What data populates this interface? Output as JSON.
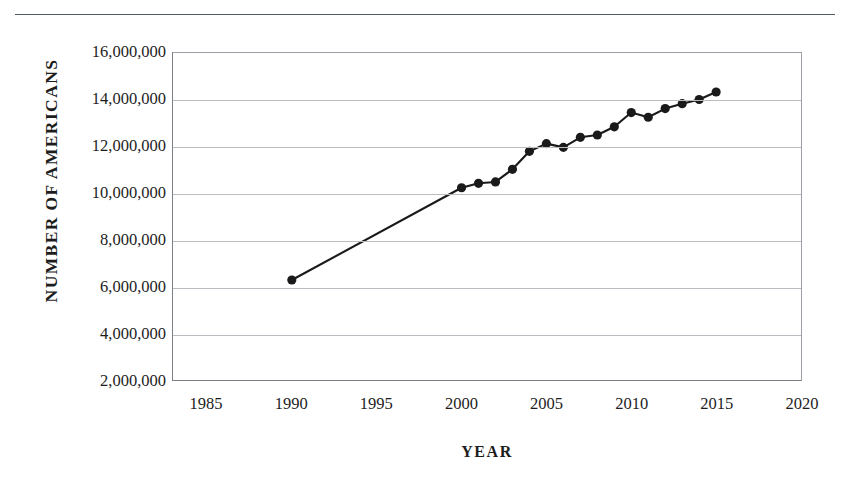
{
  "document": {
    "top_rule": "horizontal-rule"
  },
  "chart_data": {
    "type": "line",
    "title": "",
    "xlabel": "YEAR",
    "ylabel": "NUMBER OF AMERICANS",
    "xlim": [
      1983,
      2020
    ],
    "ylim": [
      2000000,
      16000000
    ],
    "grid": true,
    "legend": false,
    "marker": "filled-circle",
    "line_color": "#1a1a1a",
    "marker_color": "#1a1a1a",
    "x_ticks": [
      1985,
      1990,
      1995,
      2000,
      2005,
      2010,
      2015,
      2020
    ],
    "x_tick_labels": [
      "1985",
      "1990",
      "1995",
      "2000",
      "2005",
      "2010",
      "2015",
      "2020"
    ],
    "y_ticks": [
      2000000,
      4000000,
      6000000,
      8000000,
      10000000,
      12000000,
      14000000,
      16000000
    ],
    "y_tick_labels": [
      "2,000,000",
      "4,000,000",
      "6,000,000",
      "8,000,000",
      "10,000,000",
      "12,000,000",
      "14,000,000",
      "16,000,000"
    ],
    "x": [
      1990,
      2000,
      2001,
      2002,
      2003,
      2004,
      2005,
      2006,
      2007,
      2008,
      2009,
      2010,
      2011,
      2012,
      2013,
      2014,
      2015
    ],
    "values": [
      6280000,
      10230000,
      10420000,
      10480000,
      11020000,
      11790000,
      12120000,
      11960000,
      12390000,
      12490000,
      12840000,
      13450000,
      13250000,
      13620000,
      13830000,
      14010000,
      14330000
    ],
    "series": [
      {
        "name": "Number of Americans",
        "values": [
          6280000,
          10230000,
          10420000,
          10480000,
          11020000,
          11790000,
          12120000,
          11960000,
          12390000,
          12490000,
          12840000,
          13450000,
          13250000,
          13620000,
          13830000,
          14010000,
          14330000
        ]
      }
    ]
  },
  "source_note": {
    "text": ""
  }
}
